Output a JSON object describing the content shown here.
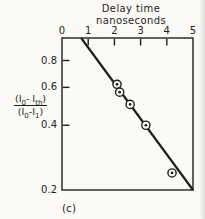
{
  "colors": {
    "ink": "#1f1e1c",
    "background": "#fbfaf6"
  },
  "figure": {
    "caption": "(c)",
    "x_axis_title": {
      "line1": "Delay time",
      "line2": "nanoseconds"
    },
    "y_axis_label": {
      "n1": "(I",
      "n2": "0",
      "n3": "- I",
      "n4": "th",
      "n5": ")",
      "d1": "(I",
      "d2": "0",
      "d3": "-I",
      "d4": "1",
      "d5": ")"
    }
  },
  "chart_data": {
    "type": "scatter",
    "x": {
      "label": "Delay time nanoseconds",
      "position": "top",
      "scale": "linear",
      "min": 0,
      "max": 5,
      "ticks": [
        0,
        1,
        2,
        3,
        4,
        5
      ],
      "tick_labels": [
        "0",
        "1",
        "2",
        "3",
        "4",
        "5"
      ]
    },
    "y": {
      "label": "(I0-Ith)/(I0-I1)",
      "position": "left",
      "scale": "log",
      "min": 0.2,
      "max": 1.018,
      "ticks": [
        0.8,
        0.6,
        0.4,
        0.2
      ],
      "tick_labels": [
        "0.8",
        "0.6",
        "0.4",
        "0.2"
      ]
    },
    "grid": false,
    "marker": "circle-dot",
    "points": [
      {
        "x": 2.1,
        "y": 0.62
      },
      {
        "x": 2.2,
        "y": 0.57
      },
      {
        "x": 2.6,
        "y": 0.5
      },
      {
        "x": 3.2,
        "y": 0.4
      },
      {
        "x": 4.2,
        "y": 0.24
      }
    ],
    "fit_line": {
      "x1": 0.73,
      "y1": 1.018,
      "x2": 5.0,
      "y2": 0.2
    }
  }
}
